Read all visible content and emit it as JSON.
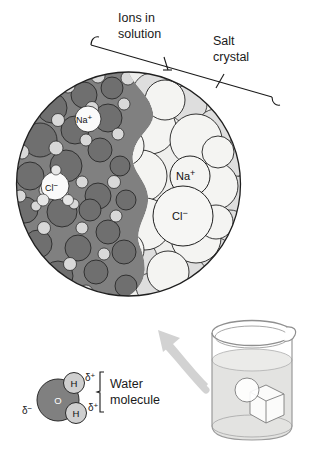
{
  "figure": {
    "background": "#ffffff"
  },
  "callouts": {
    "ions_in_solution": {
      "line1": "Ions in",
      "line2": "solution",
      "name": "ions-in-solution-label"
    },
    "salt_crystal": {
      "line1": "Salt",
      "line2": "crystal",
      "name": "salt-crystal-label"
    }
  },
  "magnified_view": {
    "name": "magnified-circle",
    "solution_region": {
      "label": "aqueous solution with hydrated ions",
      "fill": "#808080",
      "ion_labels": [
        {
          "text": "Na",
          "charge": "+",
          "x": 88,
          "y": 123
        },
        {
          "text": "Cl",
          "charge": "−",
          "x": 55,
          "y": 190
        }
      ]
    },
    "crystal_region": {
      "label": "ordered salt crystal lattice",
      "fill": "#f2f2f0",
      "ion_labels": [
        {
          "text": "Na",
          "charge": "+",
          "x": 190,
          "y": 180
        },
        {
          "text": "Cl",
          "charge": "−",
          "x": 183,
          "y": 219
        }
      ]
    },
    "colors": {
      "solution_dark": "#808080",
      "solution_sphere_dark": "#737373",
      "solution_sphere_light": "#d4d4d4",
      "crystal_light": "#efefed",
      "crystal_mid": "#dcdcda",
      "outline": "#1f1f1f"
    }
  },
  "water_molecule": {
    "name": "water-molecule-diagram",
    "label_line1": "Water",
    "label_line2": "molecule",
    "oxygen": {
      "symbol": "O",
      "fill": "#808080",
      "text_color": "#ffffff"
    },
    "hydrogen": {
      "symbol": "H",
      "fill": "#cfcfcf",
      "text_color": "#111111"
    },
    "partial_charges": [
      {
        "symbol": "δ",
        "sign": "+",
        "position": "upper-right"
      },
      {
        "symbol": "δ",
        "sign": "+",
        "position": "lower-right"
      },
      {
        "symbol": "δ",
        "sign": "−",
        "position": "left"
      }
    ]
  },
  "beaker": {
    "name": "beaker-illustration",
    "contents": "water",
    "water_fill": "#e3e3e1",
    "glass_outline": "#9a9a9a",
    "salt_cube": {
      "name": "salt-crystal-cube",
      "fill": "#fbfbfa"
    },
    "magnifier_circle": {
      "name": "magnifier-circle",
      "fill": "#ffffff"
    }
  },
  "arrow": {
    "name": "magnification-arrow",
    "color": "#d2d2d2",
    "direction": "up-left"
  }
}
